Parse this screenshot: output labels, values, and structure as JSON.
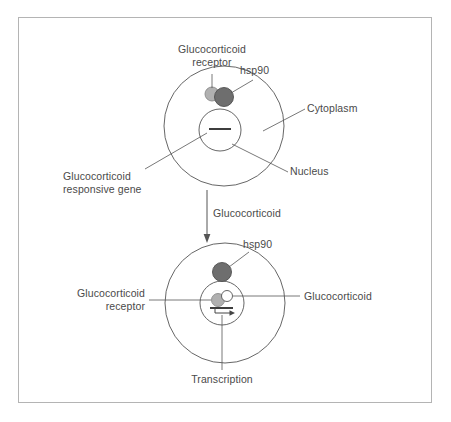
{
  "figure": {
    "border_color": "#b4b4b4",
    "background": "#ffffff",
    "line_color": "#555555",
    "text_color": "#4a4a4a"
  },
  "colors": {
    "receptor_fill": "#b0b0b0",
    "receptor_stroke": "#8a8a8a",
    "hsp90_fill": "#6e6e6e",
    "hsp90_stroke": "#4f4f4f",
    "glucocorticoid_fill": "#ffffff",
    "glucocorticoid_stroke": "#555555",
    "cell_stroke": "#555555",
    "nucleus_stroke": "#555555"
  },
  "top_cell": {
    "name": "inactive-state-cell",
    "labels": {
      "receptor": "Glucocorticoid\nreceptor",
      "hsp90": "hsp90",
      "cytoplasm": "Cytoplasm",
      "nucleus": "Nucleus",
      "gene": "Glucocorticoid\nresponsive gene"
    }
  },
  "middle_arrow": {
    "name": "glucocorticoid-entry-arrow",
    "label": "Glucocorticoid"
  },
  "bottom_cell": {
    "name": "activated-state-cell",
    "labels": {
      "hsp90": "hsp90",
      "receptor": "Glucocorticoid\nreceptor",
      "glucocorticoid": "Glucocorticoid",
      "transcription": "Transcription"
    }
  }
}
